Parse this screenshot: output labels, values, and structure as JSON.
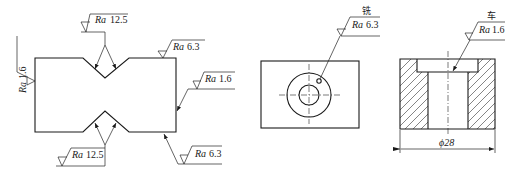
{
  "figure_1": {
    "labels": {
      "top_notch": {
        "symbol": "Ra",
        "value": "12.5"
      },
      "top_right": {
        "symbol": "Ra",
        "value": "6.3"
      },
      "left_side": {
        "symbol": "Ra",
        "value": "1.6"
      },
      "right_side": {
        "symbol": "Ra",
        "value": "1.6"
      },
      "bottom_notch": {
        "symbol": "Ra",
        "value": "12.5"
      },
      "bottom_right": {
        "symbol": "Ra",
        "value": "6.3"
      }
    }
  },
  "figure_2": {
    "process": "铣",
    "label": {
      "symbol": "Ra",
      "value": "6.3"
    }
  },
  "figure_3": {
    "process": "车",
    "label": {
      "symbol": "Ra",
      "value": "1.6"
    },
    "dimension": "ϕ28"
  }
}
